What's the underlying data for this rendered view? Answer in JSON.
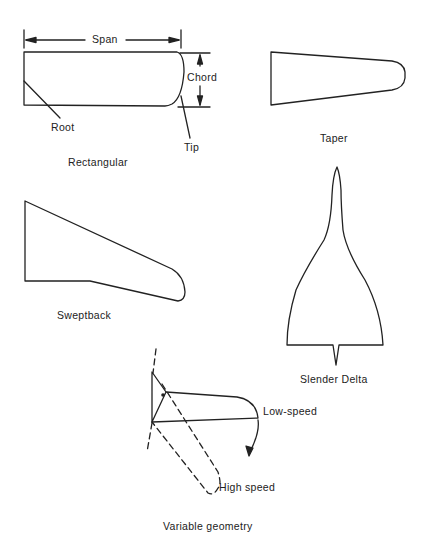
{
  "diagram": {
    "panels": [
      {
        "id": "rectangular",
        "caption": "Rectangular",
        "annotations": {
          "span": "Span",
          "chord": "Chord",
          "root": "Root",
          "tip": "Tip"
        }
      },
      {
        "id": "taper",
        "caption": "Taper"
      },
      {
        "id": "sweptback",
        "caption": "Sweptback"
      },
      {
        "id": "slender-delta",
        "caption": "Slender Delta"
      },
      {
        "id": "variable-geometry",
        "caption": "Variable geometry",
        "annotations": {
          "low_speed": "Low-speed",
          "high_speed": "High speed"
        }
      }
    ],
    "colors": {
      "stroke": "#222222",
      "background": "#ffffff"
    }
  }
}
